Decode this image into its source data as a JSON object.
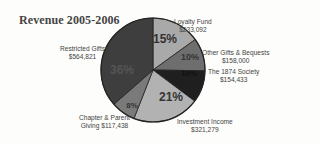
{
  "chart_data": {
    "type": "pie",
    "title": "Revenue 2005-2006",
    "categories": [
      "Loyalty Fund",
      "Other Gifts & Bequests",
      "The 1874 Society",
      "Investment Income",
      "Chapter & Parent Giving",
      "Restricted Gifts"
    ],
    "values": [
      233092,
      158000,
      154433,
      321279,
      117438,
      564821
    ],
    "value_labels": [
      "$233,092",
      "$158,000",
      "$154,433",
      "$321,279",
      "$117,438",
      "$564,821"
    ],
    "percent_labels": [
      "15%",
      "10%",
      "10%",
      "21%",
      "8%",
      "36%"
    ],
    "colors": [
      "#a9a9a9",
      "#6e6e6e",
      "#1f1f1f",
      "#b2b2b2",
      "#7a7a7a",
      "#3e3e3e"
    ],
    "start_angle": "12 o'clock, clockwise",
    "legend": "none (callout labels)"
  },
  "labels": {
    "title": "Revenue 2005-2006",
    "loyalty": {
      "name": "Loyalty Fund",
      "value": "$233,092",
      "pct": "15%"
    },
    "other": {
      "name": "Other Gifts & Bequests",
      "value": "$158,000",
      "pct": "10%"
    },
    "society": {
      "name": "The 1874 Society",
      "value": "$154,433",
      "pct": "10%"
    },
    "investment": {
      "name": "Investment Income",
      "value": "$321,279",
      "pct": "21%"
    },
    "chapter": {
      "name": "Chapter & Parent",
      "name2": "Giving",
      "value": "$117,438",
      "pct": "8%"
    },
    "restricted": {
      "name": "Restricted Gifts",
      "value": "$564,821",
      "pct": "36%"
    }
  }
}
